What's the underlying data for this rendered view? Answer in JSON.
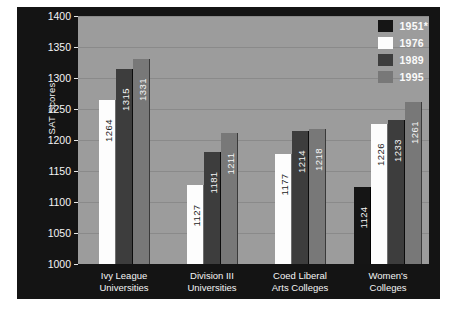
{
  "chart_data": {
    "type": "bar",
    "title": "",
    "subtitle": "",
    "xlabel": "",
    "ylabel": "SAT Scores",
    "ylim": [
      1000,
      1400
    ],
    "ytick_step": 50,
    "yticks": [
      1400,
      1350,
      1300,
      1250,
      1200,
      1150,
      1100,
      1050,
      1000
    ],
    "grid": true,
    "legend_position": "top-right",
    "categories": [
      "Ivy League Universities",
      "Division III Universities",
      "Coed Liberal Arts Colleges",
      "Women's Colleges"
    ],
    "category_lines": [
      [
        "Ivy League",
        "Universities"
      ],
      [
        "Division III",
        "Universities"
      ],
      [
        "Coed Liberal",
        "Arts Colleges"
      ],
      [
        "Women's",
        "Colleges"
      ]
    ],
    "series": [
      {
        "name": "1951*",
        "color": "#151515",
        "values": [
          null,
          null,
          null,
          1124
        ]
      },
      {
        "name": "1976",
        "color": "#fdfdfd",
        "values": [
          1264,
          1127,
          1177,
          1226
        ]
      },
      {
        "name": "1989",
        "color": "#3d3d3d",
        "values": [
          1315,
          1181,
          1214,
          1233
        ]
      },
      {
        "name": "1995",
        "color": "#787878",
        "values": [
          1331,
          1211,
          1218,
          1261
        ]
      }
    ]
  },
  "legend": {
    "items": [
      {
        "label": "1951*",
        "swatch": "s1951"
      },
      {
        "label": "1976",
        "swatch": "s1976"
      },
      {
        "label": "1989",
        "swatch": "s1989"
      },
      {
        "label": "1995",
        "swatch": "s1995"
      }
    ]
  },
  "axis": {
    "y_title": "SAT Scores",
    "y_labels": [
      "1400",
      "1350",
      "1300",
      "1250",
      "1200",
      "1150",
      "1100",
      "1050",
      "1000"
    ]
  },
  "bars": {
    "g0": [
      {
        "series": "s1976",
        "value": 1264,
        "label": "1264"
      },
      {
        "series": "s1989",
        "value": 1315,
        "label": "1315"
      },
      {
        "series": "s1995",
        "value": 1331,
        "label": "1331"
      }
    ],
    "g1": [
      {
        "series": "s1976",
        "value": 1127,
        "label": "1127"
      },
      {
        "series": "s1989",
        "value": 1181,
        "label": "1181"
      },
      {
        "series": "s1995",
        "value": 1211,
        "label": "1211"
      }
    ],
    "g2": [
      {
        "series": "s1976",
        "value": 1177,
        "label": "1177"
      },
      {
        "series": "s1989",
        "value": 1214,
        "label": "1214"
      },
      {
        "series": "s1995",
        "value": 1218,
        "label": "1218"
      }
    ],
    "g3": [
      {
        "series": "s1951",
        "value": 1124,
        "label": "1124"
      },
      {
        "series": "s1976",
        "value": 1226,
        "label": "1226"
      },
      {
        "series": "s1989",
        "value": 1233,
        "label": "1233"
      },
      {
        "series": "s1995",
        "value": 1261,
        "label": "1261"
      }
    ]
  },
  "caption": {
    "text": ""
  },
  "colors": {
    "panel_bg": "#141414",
    "plot_bg": "#9c9c9c",
    "gridline": "#8a8a8a",
    "text_light": "#f5f5f5",
    "s1951": "#151515",
    "s1976": "#fdfdfd",
    "s1989": "#3d3d3d",
    "s1995": "#787878"
  }
}
